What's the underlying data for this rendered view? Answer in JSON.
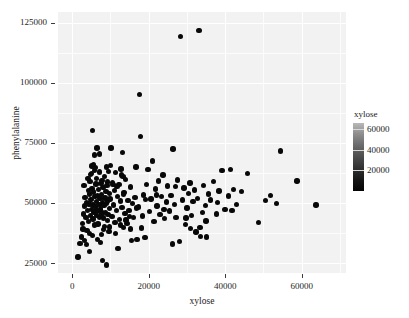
{
  "chart_data": {
    "type": "scatter",
    "title": "",
    "xlabel": "xylose",
    "ylabel": "phenylalanine",
    "xlim": [
      -3700,
      71600
    ],
    "ylim": [
      20900,
      129400
    ],
    "xticks": [
      0,
      20000,
      40000,
      60000
    ],
    "xtick_labels": [
      "0",
      "20000",
      "40000",
      "60000"
    ],
    "yticks": [
      25000,
      50000,
      75000,
      100000,
      125000
    ],
    "ytick_labels": [
      "25000",
      "50000",
      "75000",
      "100000",
      "125000"
    ],
    "grid": true,
    "grid_color": "#ffffff",
    "panel_background": "#f2f2f2",
    "point_color": "#080808",
    "legend": {
      "title": "xylose",
      "position": "right",
      "type": "colorbar",
      "ticks": [
        20000,
        40000,
        60000
      ],
      "tick_labels": [
        "20000",
        "40000",
        "60000"
      ],
      "range": [
        0,
        66000
      ],
      "gradient_low_color": "#050505",
      "gradient_high_color": "#c4c4c4"
    },
    "points": [
      [
        1500,
        27600
      ],
      [
        2100,
        33100
      ],
      [
        2500,
        35800
      ],
      [
        2700,
        41600
      ],
      [
        2900,
        45500
      ],
      [
        3100,
        57400
      ],
      [
        3300,
        48700
      ],
      [
        3400,
        52300
      ],
      [
        3600,
        44100
      ],
      [
        3700,
        50200
      ],
      [
        3900,
        38600
      ],
      [
        4000,
        46800
      ],
      [
        4200,
        55100
      ],
      [
        4300,
        42400
      ],
      [
        4400,
        49600
      ],
      [
        4500,
        53800
      ],
      [
        4600,
        29900
      ],
      [
        4700,
        58900
      ],
      [
        4800,
        44700
      ],
      [
        4900,
        51400
      ],
      [
        5000,
        47200
      ],
      [
        5100,
        62300
      ],
      [
        5200,
        56100
      ],
      [
        5300,
        80100
      ],
      [
        5400,
        43300
      ],
      [
        5500,
        49100
      ],
      [
        5600,
        54600
      ],
      [
        5700,
        46300
      ],
      [
        5800,
        63600
      ],
      [
        5900,
        40800
      ],
      [
        6000,
        52800
      ],
      [
        6100,
        48300
      ],
      [
        6200,
        57900
      ],
      [
        6300,
        44900
      ],
      [
        6400,
        50700
      ],
      [
        6500,
        72800
      ],
      [
        6600,
        53200
      ],
      [
        6700,
        46600
      ],
      [
        6800,
        41200
      ],
      [
        6900,
        55700
      ],
      [
        7000,
        49400
      ],
      [
        7100,
        62900
      ],
      [
        7200,
        44200
      ],
      [
        7300,
        51900
      ],
      [
        7400,
        47500
      ],
      [
        7500,
        58200
      ],
      [
        7600,
        36900
      ],
      [
        7700,
        53600
      ],
      [
        7800,
        45800
      ],
      [
        7900,
        50100
      ],
      [
        8000,
        26200
      ],
      [
        8100,
        56400
      ],
      [
        8200,
        43700
      ],
      [
        8300,
        48900
      ],
      [
        8400,
        61100
      ],
      [
        8500,
        40300
      ],
      [
        8600,
        52100
      ],
      [
        8700,
        46100
      ],
      [
        8800,
        54900
      ],
      [
        8900,
        49800
      ],
      [
        9000,
        24300
      ],
      [
        9100,
        57200
      ],
      [
        9200,
        42800
      ],
      [
        9300,
        50500
      ],
      [
        9400,
        45300
      ],
      [
        9500,
        63100
      ],
      [
        9600,
        38200
      ],
      [
        9700,
        53900
      ],
      [
        9800,
        47700
      ],
      [
        9900,
        51600
      ],
      [
        10200,
        72900
      ],
      [
        10400,
        44500
      ],
      [
        10600,
        58600
      ],
      [
        10800,
        49200
      ],
      [
        11000,
        55300
      ],
      [
        11200,
        41900
      ],
      [
        11400,
        62700
      ],
      [
        11600,
        46900
      ],
      [
        11800,
        52700
      ],
      [
        12000,
        31200
      ],
      [
        12200,
        57600
      ],
      [
        12400,
        43100
      ],
      [
        12600,
        50900
      ],
      [
        12800,
        64100
      ],
      [
        13000,
        48100
      ],
      [
        13200,
        71100
      ],
      [
        13400,
        39700
      ],
      [
        13600,
        54300
      ],
      [
        13800,
        45600
      ],
      [
        14000,
        59800
      ],
      [
        14300,
        41400
      ],
      [
        14600,
        51100
      ],
      [
        14900,
        47000
      ],
      [
        15200,
        56700
      ],
      [
        15500,
        34300
      ],
      [
        15800,
        49700
      ],
      [
        16100,
        43900
      ],
      [
        16400,
        52400
      ],
      [
        16700,
        65000
      ],
      [
        17000,
        34900
      ],
      [
        17400,
        48400
      ],
      [
        17600,
        95200
      ],
      [
        17800,
        77600
      ],
      [
        18100,
        39600
      ],
      [
        18400,
        44600
      ],
      [
        18700,
        53400
      ],
      [
        19000,
        35600
      ],
      [
        19400,
        57700
      ],
      [
        19800,
        63900
      ],
      [
        20200,
        46400
      ],
      [
        20600,
        51700
      ],
      [
        21000,
        67400
      ],
      [
        21400,
        42200
      ],
      [
        21800,
        55900
      ],
      [
        22200,
        48800
      ],
      [
        22600,
        59100
      ],
      [
        23000,
        45100
      ],
      [
        23400,
        52600
      ],
      [
        23800,
        61700
      ],
      [
        24200,
        43500
      ],
      [
        24600,
        50400
      ],
      [
        25000,
        57000
      ],
      [
        25400,
        46700
      ],
      [
        25800,
        53100
      ],
      [
        26200,
        33000
      ],
      [
        26400,
        72500
      ],
      [
        26800,
        49300
      ],
      [
        27200,
        44000
      ],
      [
        27600,
        59500
      ],
      [
        28000,
        34100
      ],
      [
        28400,
        119200
      ],
      [
        28800,
        51300
      ],
      [
        29200,
        56200
      ],
      [
        29600,
        41100
      ],
      [
        30000,
        47900
      ],
      [
        30400,
        54000
      ],
      [
        30800,
        58300
      ],
      [
        31200,
        44800
      ],
      [
        31600,
        50600
      ],
      [
        32000,
        55400
      ],
      [
        32400,
        38000
      ],
      [
        32800,
        52000
      ],
      [
        33200,
        121800
      ],
      [
        33600,
        36100
      ],
      [
        34000,
        46000
      ],
      [
        34400,
        57300
      ],
      [
        34800,
        49000
      ],
      [
        35200,
        35800
      ],
      [
        35600,
        53700
      ],
      [
        36200,
        51200
      ],
      [
        37000,
        59000
      ],
      [
        37800,
        45400
      ],
      [
        38400,
        55000
      ],
      [
        39200,
        63500
      ],
      [
        40000,
        47300
      ],
      [
        40800,
        52900
      ],
      [
        41400,
        63900
      ],
      [
        42200,
        55700
      ],
      [
        43000,
        49500
      ],
      [
        44200,
        54800
      ],
      [
        45800,
        62300
      ],
      [
        48800,
        41900
      ],
      [
        50600,
        51000
      ],
      [
        51800,
        53000
      ],
      [
        53400,
        49800
      ],
      [
        54400,
        71600
      ],
      [
        58800,
        59200
      ],
      [
        63800,
        49200
      ],
      [
        5200,
        65400
      ],
      [
        5600,
        66000
      ],
      [
        6000,
        64700
      ],
      [
        12900,
        61600
      ],
      [
        13300,
        60900
      ],
      [
        6400,
        60200
      ],
      [
        7800,
        59300
      ],
      [
        9300,
        58800
      ],
      [
        10700,
        57800
      ],
      [
        4600,
        37400
      ],
      [
        5300,
        36500
      ],
      [
        6700,
        34800
      ],
      [
        7400,
        33600
      ],
      [
        8200,
        38900
      ],
      [
        9700,
        40100
      ],
      [
        11300,
        37200
      ],
      [
        12700,
        40900
      ],
      [
        14100,
        43000
      ],
      [
        15300,
        39200
      ],
      [
        3200,
        34500
      ],
      [
        3800,
        32800
      ],
      [
        2800,
        39200
      ],
      [
        4100,
        60300
      ],
      [
        4800,
        61800
      ],
      [
        5900,
        69900
      ],
      [
        7200,
        70400
      ],
      [
        8900,
        64900
      ],
      [
        10100,
        65600
      ],
      [
        11700,
        56900
      ],
      [
        13500,
        53500
      ],
      [
        15000,
        44300
      ],
      [
        16800,
        48000
      ],
      [
        19200,
        51500
      ],
      [
        22000,
        53300
      ],
      [
        24000,
        47400
      ],
      [
        27000,
        56800
      ],
      [
        29800,
        43800
      ],
      [
        31000,
        39500
      ],
      [
        33400,
        39900
      ],
      [
        35000,
        42600
      ],
      [
        38000,
        50200
      ],
      [
        41800,
        46800
      ]
    ]
  }
}
